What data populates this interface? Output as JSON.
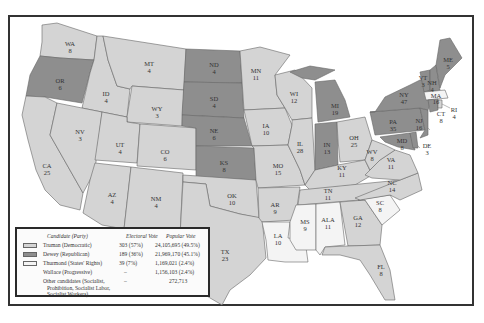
{
  "map": {
    "title": "1948 Presidential Election",
    "colors": {
      "truman": "#d4d4d4",
      "dewey": "#8e8e8e",
      "thurmond": "#f4f4f4",
      "water": "#ffffff",
      "border": "#555555"
    },
    "states": [
      {
        "abbr": "WA",
        "ev": "8",
        "party": "truman"
      },
      {
        "abbr": "OR",
        "ev": "6",
        "party": "dewey"
      },
      {
        "abbr": "CA",
        "ev": "25",
        "party": "truman"
      },
      {
        "abbr": "ID",
        "ev": "4",
        "party": "truman"
      },
      {
        "abbr": "NV",
        "ev": "3",
        "party": "truman"
      },
      {
        "abbr": "MT",
        "ev": "4",
        "party": "truman"
      },
      {
        "abbr": "WY",
        "ev": "3",
        "party": "truman"
      },
      {
        "abbr": "UT",
        "ev": "4",
        "party": "truman"
      },
      {
        "abbr": "CO",
        "ev": "6",
        "party": "truman"
      },
      {
        "abbr": "AZ",
        "ev": "4",
        "party": "truman"
      },
      {
        "abbr": "NM",
        "ev": "4",
        "party": "truman"
      },
      {
        "abbr": "ND",
        "ev": "4",
        "party": "dewey"
      },
      {
        "abbr": "SD",
        "ev": "4",
        "party": "dewey"
      },
      {
        "abbr": "NE",
        "ev": "6",
        "party": "dewey"
      },
      {
        "abbr": "KS",
        "ev": "8",
        "party": "dewey"
      },
      {
        "abbr": "OK",
        "ev": "10",
        "party": "truman"
      },
      {
        "abbr": "TX",
        "ev": "23",
        "party": "truman"
      },
      {
        "abbr": "MN",
        "ev": "11",
        "party": "truman"
      },
      {
        "abbr": "IA",
        "ev": "10",
        "party": "truman"
      },
      {
        "abbr": "MO",
        "ev": "15",
        "party": "truman"
      },
      {
        "abbr": "AR",
        "ev": "9",
        "party": "truman"
      },
      {
        "abbr": "LA",
        "ev": "10",
        "party": "thurmond"
      },
      {
        "abbr": "WI",
        "ev": "12",
        "party": "truman"
      },
      {
        "abbr": "IL",
        "ev": "28",
        "party": "truman"
      },
      {
        "abbr": "MI",
        "ev": "19",
        "party": "dewey"
      },
      {
        "abbr": "IN",
        "ev": "13",
        "party": "dewey"
      },
      {
        "abbr": "OH",
        "ev": "25",
        "party": "truman"
      },
      {
        "abbr": "KY",
        "ev": "11",
        "party": "truman"
      },
      {
        "abbr": "TN",
        "ev": "11",
        "party": "truman"
      },
      {
        "abbr": "MS",
        "ev": "9",
        "party": "thurmond"
      },
      {
        "abbr": "ALA",
        "ev": "11",
        "party": "thurmond"
      },
      {
        "abbr": "GA",
        "ev": "12",
        "party": "truman"
      },
      {
        "abbr": "FL",
        "ev": "8",
        "party": "truman"
      },
      {
        "abbr": "SC",
        "ev": "8",
        "party": "thurmond"
      },
      {
        "abbr": "NC",
        "ev": "14",
        "party": "truman"
      },
      {
        "abbr": "VA",
        "ev": "11",
        "party": "truman"
      },
      {
        "abbr": "WV",
        "ev": "8",
        "party": "truman"
      },
      {
        "abbr": "MD",
        "ev": "8",
        "party": "dewey"
      },
      {
        "abbr": "DE",
        "ev": "3",
        "party": "dewey"
      },
      {
        "abbr": "PA",
        "ev": "35",
        "party": "dewey"
      },
      {
        "abbr": "NJ",
        "ev": "16",
        "party": "dewey"
      },
      {
        "abbr": "NY",
        "ev": "47",
        "party": "dewey"
      },
      {
        "abbr": "CT",
        "ev": "8",
        "party": "dewey"
      },
      {
        "abbr": "RI",
        "ev": "4",
        "party": "truman"
      },
      {
        "abbr": "MA",
        "ev": "16",
        "party": "truman"
      },
      {
        "abbr": "VT",
        "ev": "3",
        "party": "dewey"
      },
      {
        "abbr": "NH",
        "ev": "4",
        "party": "dewey"
      },
      {
        "abbr": "ME",
        "ev": "5",
        "party": "dewey"
      }
    ]
  },
  "legend": {
    "headers": {
      "candidate": "Candidate (Party)",
      "electoral": "Electoral Vote",
      "popular": "Popular Vote"
    },
    "rows": [
      {
        "candidate": "Truman (Democratic)",
        "electoral": "303 (57%)",
        "popular": "24,105,695 (49.5%)",
        "swatch": "truman"
      },
      {
        "candidate": "Dewey (Republican)",
        "electoral": "189 (36%)",
        "popular": "21,969,170 (45.1%)",
        "swatch": "dewey"
      },
      {
        "candidate": "Thurmond (States' Rights)",
        "electoral": "39 (7%)",
        "popular": "1,169,021 (2.4%)",
        "swatch": "thurmond"
      },
      {
        "candidate": "Wallace (Progressive)",
        "electoral": "–",
        "popular": "1,156,103 (2.4%)",
        "swatch": ""
      },
      {
        "candidate": "Other candidates (Socialist, Prohibition, Socialist Labor, Socialist Workers)",
        "electoral": "–",
        "popular": "272,713",
        "swatch": ""
      }
    ],
    "other_line1": "Other candidates (Socialist,",
    "other_line2": "Prohibition, Socialist Labor,",
    "other_line3": "Socialist Workers)"
  }
}
